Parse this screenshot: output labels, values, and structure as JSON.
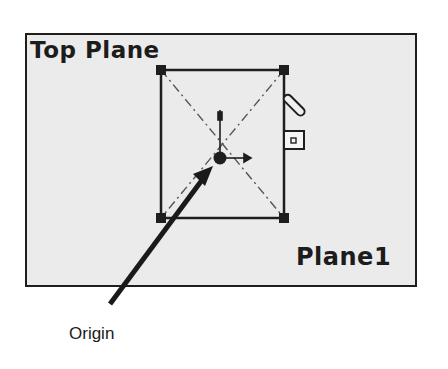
{
  "diagram": {
    "view_title": "Top Plane",
    "plane_name": "Plane1",
    "callout": {
      "label": "Origin",
      "target": "origin-point"
    },
    "sketch": {
      "shape": "rectangle",
      "corners": [
        [
          161,
          70
        ],
        [
          284,
          70
        ],
        [
          161,
          218
        ],
        [
          284,
          218
        ]
      ],
      "diagonals": "construction-dashed",
      "origin": [
        220,
        158
      ]
    },
    "icons": [
      "pencil-icon",
      "sketch-relation-icon",
      "origin-axis-icon"
    ],
    "colors": {
      "background": "#ffffff",
      "plane_fill": "#ebebeb",
      "line": "#1e1e1e"
    }
  }
}
